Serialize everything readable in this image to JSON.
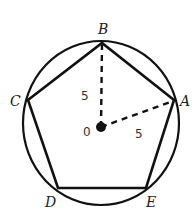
{
  "diagram": {
    "type": "inscribed-regular-pentagon",
    "colors": {
      "stroke": "#111111",
      "background": "#ffffff"
    },
    "circle": {
      "cx": 101,
      "cy": 123,
      "rx": 78,
      "ry": 82
    },
    "center": {
      "label": "0",
      "x": 101,
      "y": 127
    },
    "vertices": [
      {
        "label": "A",
        "x": 174,
        "y": 100
      },
      {
        "label": "B",
        "x": 102,
        "y": 43
      },
      {
        "label": "C",
        "x": 28,
        "y": 100
      },
      {
        "label": "D",
        "x": 58,
        "y": 188
      },
      {
        "label": "E",
        "x": 146,
        "y": 188
      }
    ],
    "radii": [
      {
        "from": "0",
        "to": "B",
        "label": "5"
      },
      {
        "from": "0",
        "to": "A",
        "label": "5"
      }
    ]
  }
}
